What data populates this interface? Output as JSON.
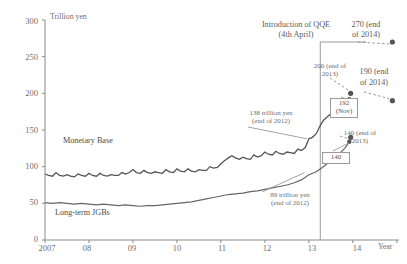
{
  "chart_data": {
    "type": "line",
    "title": "",
    "ylabel": "Trillion yen",
    "xlabel": "Year",
    "ylim": [
      0,
      300
    ],
    "yticks": [
      0,
      50,
      100,
      150,
      200,
      250,
      300
    ],
    "xticks": [
      "2007",
      "08",
      "09",
      "10",
      "11",
      "12",
      "13",
      "14"
    ],
    "xlim": [
      "2007",
      "2014.9"
    ],
    "grid": false,
    "legend_position": "inline-labels",
    "series": [
      {
        "name": "Monetary Base",
        "color": "#555555",
        "x": [
          2007.0,
          2007.08,
          2007.17,
          2007.25,
          2007.33,
          2007.42,
          2007.5,
          2007.58,
          2007.67,
          2007.75,
          2007.83,
          2007.92,
          2008.0,
          2008.08,
          2008.17,
          2008.25,
          2008.33,
          2008.42,
          2008.5,
          2008.58,
          2008.67,
          2008.75,
          2008.83,
          2008.92,
          2009.0,
          2009.08,
          2009.17,
          2009.25,
          2009.33,
          2009.42,
          2009.5,
          2009.58,
          2009.67,
          2009.75,
          2009.83,
          2009.92,
          2010.0,
          2010.08,
          2010.17,
          2010.25,
          2010.33,
          2010.42,
          2010.5,
          2010.58,
          2010.67,
          2010.75,
          2010.83,
          2010.92,
          2011.0,
          2011.08,
          2011.17,
          2011.25,
          2011.33,
          2011.42,
          2011.5,
          2011.58,
          2011.67,
          2011.75,
          2011.83,
          2011.92,
          2012.0,
          2012.08,
          2012.17,
          2012.25,
          2012.33,
          2012.42,
          2012.5,
          2012.58,
          2012.67,
          2012.75,
          2012.83,
          2012.92,
          2013.0,
          2013.08,
          2013.17,
          2013.25,
          2013.33,
          2013.42,
          2013.5,
          2013.58,
          2013.67,
          2013.75,
          2013.83,
          2013.92
        ],
        "values": [
          90,
          88,
          87,
          92,
          88,
          87,
          89,
          87,
          86,
          90,
          88,
          87,
          91,
          88,
          87,
          91,
          88,
          87,
          89,
          88,
          88,
          92,
          90,
          92,
          96,
          92,
          91,
          95,
          92,
          91,
          93,
          92,
          91,
          96,
          93,
          92,
          97,
          94,
          93,
          97,
          94,
          93,
          96,
          95,
          95,
          100,
          98,
          99,
          104,
          108,
          112,
          115,
          112,
          110,
          113,
          111,
          110,
          116,
          113,
          115,
          120,
          117,
          116,
          121,
          118,
          117,
          120,
          119,
          118,
          124,
          122,
          126,
          138,
          140,
          145,
          155,
          163,
          168,
          172,
          175,
          178,
          182,
          186,
          192
        ]
      },
      {
        "name": "Long-term JGBs",
        "color": "#666666",
        "x": [
          2007.0,
          2007.17,
          2007.33,
          2007.5,
          2007.67,
          2007.83,
          2008.0,
          2008.17,
          2008.33,
          2008.5,
          2008.67,
          2008.83,
          2009.0,
          2009.17,
          2009.33,
          2009.5,
          2009.67,
          2009.83,
          2010.0,
          2010.17,
          2010.33,
          2010.5,
          2010.67,
          2010.83,
          2011.0,
          2011.17,
          2011.33,
          2011.5,
          2011.67,
          2011.83,
          2012.0,
          2012.17,
          2012.33,
          2012.5,
          2012.67,
          2012.83,
          2013.0,
          2013.17,
          2013.33,
          2013.5,
          2013.67,
          2013.83,
          2013.92
        ],
        "values": [
          51,
          50,
          51,
          50,
          49,
          50,
          49,
          48,
          49,
          48,
          47,
          48,
          47,
          46,
          47,
          47,
          48,
          49,
          50,
          51,
          52,
          54,
          56,
          58,
          60,
          62,
          63,
          64,
          66,
          67,
          69,
          71,
          73,
          75,
          78,
          82,
          89,
          93,
          100,
          108,
          116,
          126,
          134
        ]
      }
    ],
    "markers": [
      {
        "label": "270 (end of 2014)",
        "x": 2014.9,
        "y": 270,
        "name": "mb-2014-projection"
      },
      {
        "label": "200 (end of 2013)",
        "x": 2013.95,
        "y": 200,
        "name": "mb-2013-projection"
      },
      {
        "label": "190 (end of 2014)",
        "x": 2014.9,
        "y": 190,
        "name": "jgb-2014-projection"
      },
      {
        "label": "140 (end of 2013)",
        "x": 2013.95,
        "y": 140,
        "name": "jgb-2013-projection"
      }
    ],
    "boxed_values": [
      {
        "line1": "192",
        "line2": "(Nov)",
        "name": "monetary-base-actual-box"
      },
      {
        "line1": "140",
        "line2": "",
        "name": "jgb-actual-box"
      }
    ],
    "annotations": [
      {
        "text": "Introduction of QQE",
        "line2": "(4th April)",
        "name": "qqe-introduction-label"
      },
      {
        "text": "138 trillion yen",
        "line2": "(end of 2012)",
        "name": "monetary-base-2012-label"
      },
      {
        "text": "89 trillion yen",
        "line2": "(end of 2012)",
        "name": "jgb-2012-label"
      }
    ],
    "vertical_marker": {
      "x": 2013.26,
      "label": "Introduction of QQE (4th April)"
    }
  },
  "axis": {
    "y_title": "Trillion yen",
    "x_title": "Year",
    "y_ticks": [
      "300",
      "250",
      "200",
      "150",
      "100",
      "50",
      "0"
    ],
    "x_ticks": [
      "2007",
      "08",
      "09",
      "10",
      "11",
      "12",
      "13",
      "14"
    ]
  },
  "series_labels": {
    "monetary_base": "Monetary Base",
    "long_term_jgbs": "Long-term JGBs"
  },
  "annotations": {
    "qqe_line1": "Introduction of QQE",
    "qqe_line2": "(4th April)",
    "mb270_line1": "270 (end",
    "mb270_line2": "of 2014)",
    "mb200_line1": "200 (end of",
    "mb200_line2": "2013)",
    "jgb190_line1": "190 (end",
    "jgb190_line2": "of 2014)",
    "jgb140_line1": "140 (end of",
    "jgb140_line2": "2013)",
    "mb138_line1": "138 trillion yen",
    "mb138_line2": "(end of 2012)",
    "jgb89_line1": "89 trillion yen",
    "jgb89_line2": "(end of 2012)"
  },
  "boxes": {
    "mb_value": "192",
    "mb_month": "(Nov)",
    "jgb_value": "140"
  },
  "colors": {
    "line": "#555555",
    "axis": "#888888",
    "text": "#6e6e6e",
    "marker": "#555555",
    "box_border": "#9a9a9a"
  }
}
